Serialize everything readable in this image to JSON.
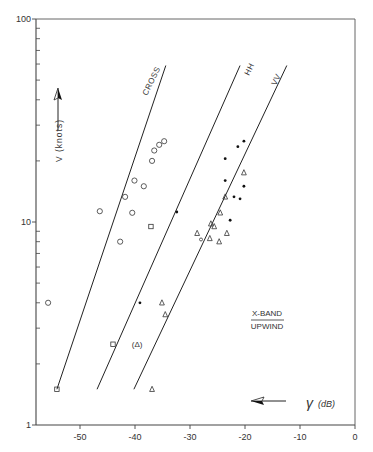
{
  "chart_data": {
    "type": "scatter",
    "title": "",
    "annotation": {
      "line1": "X-BAND",
      "line2": "UPWIND"
    },
    "xlabel": "γ (dB)",
    "ylabel": "V (knots)",
    "xlim": [
      -58,
      0
    ],
    "ylim": [
      1,
      100
    ],
    "yscale": "log",
    "x_ticks": [
      -50,
      -40,
      -30,
      -20,
      -10,
      0
    ],
    "x_tick_labels": [
      "-50",
      "-40",
      "-30",
      "-20",
      "-10",
      "0"
    ],
    "y_ticks": [
      1,
      10,
      100
    ],
    "y_tick_labels": [
      "1",
      "10",
      "100"
    ],
    "grid": false,
    "legend": null,
    "lines": [
      {
        "name": "CROSS",
        "x": [
          -54.2,
          -34.4
        ],
        "y": [
          1.5,
          59
        ]
      },
      {
        "name": "HH",
        "x": [
          -46.9,
          -20.9
        ],
        "y": [
          1.5,
          59
        ]
      },
      {
        "name": "VV",
        "x": [
          -40.2,
          -12.4
        ],
        "y": [
          1.5,
          59
        ]
      }
    ],
    "series": [
      {
        "name": "open circles",
        "marker": "circle-open",
        "x": [
          -55.8,
          -46.4,
          -42.7,
          -41.8,
          -40.1,
          -40.5,
          -38.4,
          -36.9,
          -36.5,
          -35.6,
          -34.7
        ],
        "y": [
          4.0,
          11.3,
          8.0,
          13.3,
          16.0,
          11.1,
          15.0,
          20.0,
          22.5,
          24.0,
          25.0
        ]
      },
      {
        "name": "open squares",
        "marker": "square-open",
        "x": [
          -37.1,
          -54.2,
          -44.0
        ],
        "y": [
          9.5,
          1.5,
          2.5
        ]
      },
      {
        "name": "filled dots",
        "marker": "dot",
        "x": [
          -32.4,
          -39.1,
          -23.6,
          -21.3,
          -23.6,
          -20.2,
          -22.0,
          -22.7,
          -20.9,
          -20.2
        ],
        "y": [
          11.2,
          4.0,
          20.5,
          23.5,
          16.0,
          15.0,
          13.3,
          10.2,
          13.0,
          25.0
        ],
        "marker_size_note": "solid small dots"
      },
      {
        "name": "open triangles",
        "marker": "triangle-open",
        "x": [
          -20.2,
          -23.6,
          -24.5,
          -25.6,
          -23.3,
          -26.2,
          -28.7,
          -24.7,
          -26.4,
          -35.1,
          -34.5,
          -36.9
        ],
        "y": [
          17.5,
          13.3,
          11.1,
          9.5,
          8.8,
          9.8,
          8.8,
          8.0,
          8.3,
          4.0,
          3.5,
          1.5
        ]
      },
      {
        "name": "bracketed triangle",
        "marker": "triangle-bracketed",
        "label": "(Δ)",
        "x": [
          -39.6
        ],
        "y": [
          2.5
        ]
      },
      {
        "name": "small circle",
        "marker": "circle-small",
        "x": [
          -28.0
        ],
        "y": [
          8.2
        ]
      }
    ]
  },
  "labels": {
    "y_axis": "V (knots)",
    "x_axis_symbol": "γ",
    "x_axis_unit": "(dB)",
    "band": "X-BAND",
    "wind": "UPWIND",
    "line_cross": "CROSS",
    "line_hh": "HH",
    "line_vv": "VV",
    "bracket_tri": "(Δ)"
  },
  "colors": {
    "ink": "#222222",
    "axis": "#444444",
    "background": "#ffffff"
  }
}
